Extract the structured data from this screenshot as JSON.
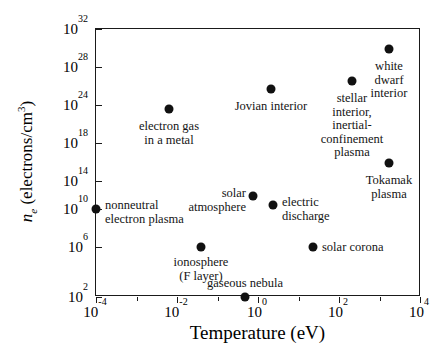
{
  "chart_data": {
    "type": "scatter",
    "title": "",
    "xlabel": "Temperature (eV)",
    "ylabel": "n_e (electrons/cm^3)",
    "xscale": "log",
    "yscale": "log",
    "xlim": [
      1e-05,
      100000.0
    ],
    "ylim": [
      100.0,
      1e+32
    ],
    "grid": false,
    "legend": "none",
    "xticks": [
      "10^-4",
      "10^-2",
      "10^0",
      "10^2",
      "10^4"
    ],
    "yticks": [
      "10^2",
      "10^6",
      "10^10",
      "10^14",
      "10^18",
      "10^24",
      "10^28",
      "10^32"
    ],
    "points": [
      {
        "label": "nonneutral\nelectron plasma",
        "x": "1e-4",
        "y": "1e10",
        "x_px": 95,
        "y_px": 208,
        "lx": 104,
        "ly": 198,
        "align": "l"
      },
      {
        "label": "electron gas\nin a metal",
        "x": "1e-2",
        "y": "4e22",
        "x_px": 168,
        "y_px": 108,
        "lx": 168,
        "ly": 119,
        "align": "c"
      },
      {
        "label": "ionosphere\n(F layer)",
        "x": "1e-1",
        "y": "1e6",
        "x_px": 200,
        "y_px": 246,
        "lx": 200,
        "ly": 255,
        "align": "c"
      },
      {
        "label": "solar\natmosphere",
        "x": "1",
        "y": "1e11",
        "x_px": 252,
        "y_px": 195,
        "lx": 245,
        "ly": 186,
        "align": "r"
      },
      {
        "label": "gaseous nebula",
        "x": "1.3",
        "y": "1e2",
        "x_px": 244,
        "y_px": 296,
        "lx": 244,
        "ly": 276,
        "align": "c"
      },
      {
        "label": "Jovian interior",
        "x": "4",
        "y": "2e25",
        "x_px": 270,
        "y_px": 88,
        "lx": 270,
        "ly": 99,
        "align": "c"
      },
      {
        "label": "electric\ndischarge",
        "x": "5",
        "y": "2e10",
        "x_px": 272,
        "y_px": 204,
        "lx": 281,
        "ly": 195,
        "align": "l"
      },
      {
        "label": "solar corona",
        "x": "1e2",
        "y": "1e6",
        "x_px": 312,
        "y_px": 246,
        "lx": 321,
        "ly": 240,
        "align": "l"
      },
      {
        "label": "stellar interior,\ninertial-confinement\nplasma",
        "x": "1e3",
        "y": "3e26",
        "x_px": 351,
        "y_px": 80,
        "lx": 351,
        "ly": 91,
        "align": "c"
      },
      {
        "label": "white dwarf\ninterior",
        "x": "1e4",
        "y": "5e29",
        "x_px": 388,
        "y_px": 48,
        "lx": 388,
        "ly": 59,
        "align": "c"
      },
      {
        "label": "Tokamak\nplasma",
        "x": "1e4",
        "y": "2e15",
        "x_px": 388,
        "y_px": 162,
        "lx": 388,
        "ly": 173,
        "align": "c"
      }
    ]
  },
  "axes": {
    "x_title": "Temperature (eV)",
    "y_title_symbol": "n",
    "y_title_sub": "e",
    "y_title_rest": " (electrons/cm",
    "y_title_sup": "3",
    "y_title_close": ")",
    "x_ticks": [
      {
        "mantissa": "10",
        "exp": "-4",
        "x_px": 95
      },
      {
        "mantissa": "10",
        "exp": "-2",
        "x_px": 176
      },
      {
        "mantissa": "10",
        "exp": "0",
        "x_px": 257
      },
      {
        "mantissa": "10",
        "exp": "2",
        "x_px": 338
      },
      {
        "mantissa": "10",
        "exp": "4",
        "x_px": 419
      }
    ],
    "y_ticks": [
      {
        "mantissa": "10",
        "exp": "32",
        "y_px": 28
      },
      {
        "mantissa": "10",
        "exp": "28",
        "y_px": 66
      },
      {
        "mantissa": "10",
        "exp": "24",
        "y_px": 104
      },
      {
        "mantissa": "10",
        "exp": "18",
        "y_px": 142
      },
      {
        "mantissa": "10",
        "exp": "14",
        "y_px": 180
      },
      {
        "mantissa": "10",
        "exp": "10",
        "y_px": 208
      },
      {
        "mantissa": "10",
        "exp": "6",
        "y_px": 246
      },
      {
        "mantissa": "10",
        "exp": "2",
        "y_px": 296
      }
    ]
  },
  "style": {
    "marker_color": "#111111",
    "axis_color": "#1a1a1a",
    "text_color": "#141414",
    "background": "#ffffff"
  }
}
